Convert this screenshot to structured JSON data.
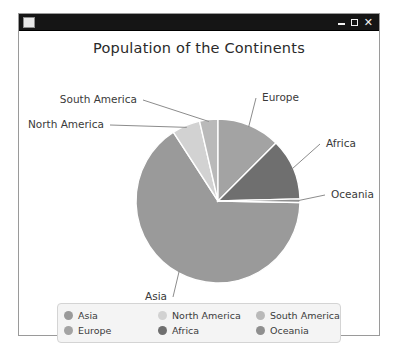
{
  "window": {
    "icon_name": "app-icon",
    "controls": {
      "minimize": "–",
      "maximize": "□",
      "close": "✕"
    }
  },
  "chart_data": {
    "type": "pie",
    "title": "Population of the Continents",
    "xlabel": "",
    "ylabel": "",
    "legend_position": "bottom",
    "grid": false,
    "categories": [
      "Asia",
      "North America",
      "South America",
      "Europe",
      "Africa",
      "Oceania"
    ],
    "values": [
      59.5,
      5.5,
      3.5,
      12.5,
      18.5,
      0.5
    ],
    "units": "percent of world population",
    "colors": [
      "#9a9a9a",
      "#d2d2d2",
      "#b9b9b9",
      "#a3a3a3",
      "#6f6f6f",
      "#8f8f8f"
    ],
    "slices": [
      {
        "label": "Asia",
        "percent": 59.5,
        "color": "#9a9a9a",
        "start_deg": 123,
        "end_deg": 359
      },
      {
        "label": "North America",
        "percent": 5.5,
        "color": "#d2d2d2",
        "start_deg": 103,
        "end_deg": 123
      },
      {
        "label": "South America",
        "percent": 3.5,
        "color": "#b9b9b9",
        "start_deg": 90,
        "end_deg": 103
      },
      {
        "label": "Europe",
        "percent": 12.5,
        "color": "#a3a3a3",
        "start_deg": 45,
        "end_deg": 90
      },
      {
        "label": "Africa",
        "percent": 18.5,
        "color": "#6f6f6f",
        "start_deg": 1.5,
        "end_deg": 45
      },
      {
        "label": "Oceania",
        "percent": 0.5,
        "color": "#8f8f8f",
        "start_deg": 359,
        "end_deg": 1.5
      }
    ],
    "annotations": [
      {
        "text": "South America",
        "x": 118,
        "y": 72
      },
      {
        "text": "North America",
        "x": 85,
        "y": 97
      },
      {
        "text": "Europe",
        "x": 243,
        "y": 70
      },
      {
        "text": "Africa",
        "x": 307,
        "y": 116
      },
      {
        "text": "Oceania",
        "x": 312,
        "y": 167
      },
      {
        "text": "Asia",
        "x": 148,
        "y": 269
      }
    ]
  },
  "legend": {
    "entries": [
      {
        "label": "Asia",
        "color": "#9a9a9a"
      },
      {
        "label": "North America",
        "color": "#d2d2d2"
      },
      {
        "label": "South America",
        "color": "#b9b9b9"
      },
      {
        "label": "Europe",
        "color": "#a3a3a3"
      },
      {
        "label": "Africa",
        "color": "#6f6f6f"
      },
      {
        "label": "Oceania",
        "color": "#8f8f8f"
      }
    ]
  }
}
